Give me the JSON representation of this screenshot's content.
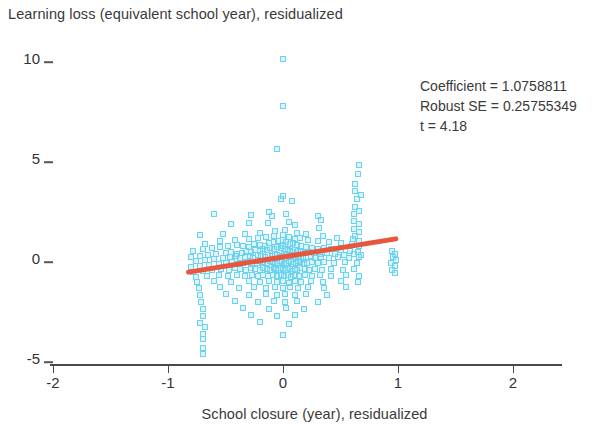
{
  "chart_data": {
    "type": "scatter",
    "title": "",
    "ylabel": "Learning loss (equivalent school year), residualized",
    "xlabel": "School closure (year), residualized",
    "xlim": [
      -2.4,
      2.45
    ],
    "ylim": [
      -5.6,
      10.6
    ],
    "xticks": [
      -2,
      -1,
      0,
      1,
      2
    ],
    "xtick_labels": [
      "-2",
      "-1",
      "0",
      "1",
      "2"
    ],
    "yticks": [
      10,
      5,
      0,
      -5
    ],
    "ytick_labels": [
      "10",
      "5",
      "0",
      "-5"
    ],
    "grid": false,
    "legend": null,
    "marker": {
      "shape": "square-hollow",
      "color": "#6ad2ef",
      "size": 6
    },
    "fit_line": {
      "color": "#e8563c",
      "slope": 1.0758811,
      "x_start": -0.845,
      "x_end": 1.0,
      "y_start": -0.7,
      "y_end": 1.0
    },
    "annotations": [
      "Coefficient = 1.0758811",
      "Robust SE = 0.25755349",
      "t = 4.18"
    ],
    "points": [
      [
        0.0,
        9.95
      ],
      [
        0.0,
        7.6
      ],
      [
        -0.05,
        5.45
      ],
      [
        0.66,
        4.65
      ],
      [
        0.65,
        4.2
      ],
      [
        0.63,
        3.7
      ],
      [
        0.63,
        3.35
      ],
      [
        0.68,
        3.15
      ],
      [
        0.64,
        2.95
      ],
      [
        0.0,
        3.1
      ],
      [
        -0.02,
        2.95
      ],
      [
        0.08,
        2.85
      ],
      [
        0.63,
        2.55
      ],
      [
        0.66,
        2.35
      ],
      [
        0.62,
        2.2
      ],
      [
        -0.6,
        2.2
      ],
      [
        -0.28,
        2.15
      ],
      [
        -0.12,
        2.3
      ],
      [
        -0.1,
        2.1
      ],
      [
        0.03,
        2.2
      ],
      [
        0.3,
        2.1
      ],
      [
        0.33,
        1.9
      ],
      [
        0.62,
        1.85
      ],
      [
        0.66,
        1.7
      ],
      [
        -0.45,
        1.7
      ],
      [
        -0.3,
        1.75
      ],
      [
        -0.13,
        1.75
      ],
      [
        0.05,
        1.8
      ],
      [
        0.1,
        1.65
      ],
      [
        0.31,
        1.5
      ],
      [
        0.62,
        1.45
      ],
      [
        0.66,
        1.3
      ],
      [
        0.63,
        1.1
      ],
      [
        -0.72,
        1.15
      ],
      [
        -0.52,
        1.2
      ],
      [
        -0.33,
        1.2
      ],
      [
        -0.2,
        1.25
      ],
      [
        -0.07,
        1.35
      ],
      [
        0.02,
        1.4
      ],
      [
        0.12,
        1.25
      ],
      [
        0.2,
        1.2
      ],
      [
        0.35,
        1.1
      ],
      [
        0.47,
        1.0
      ],
      [
        0.61,
        0.95
      ],
      [
        0.66,
        0.85
      ],
      [
        -0.68,
        0.7
      ],
      [
        -0.55,
        0.85
      ],
      [
        -0.42,
        0.9
      ],
      [
        -0.3,
        0.95
      ],
      [
        -0.22,
        1.0
      ],
      [
        -0.15,
        1.05
      ],
      [
        -0.08,
        1.1
      ],
      [
        0.0,
        1.15
      ],
      [
        0.05,
        1.05
      ],
      [
        0.1,
        0.95
      ],
      [
        0.15,
        1.0
      ],
      [
        0.22,
        0.9
      ],
      [
        0.3,
        0.85
      ],
      [
        0.4,
        0.8
      ],
      [
        0.5,
        0.75
      ],
      [
        0.6,
        0.7
      ],
      [
        0.66,
        0.6
      ],
      [
        -0.78,
        0.35
      ],
      [
        -0.7,
        0.45
      ],
      [
        -0.62,
        0.5
      ],
      [
        -0.55,
        0.55
      ],
      [
        -0.48,
        0.6
      ],
      [
        -0.4,
        0.65
      ],
      [
        -0.35,
        0.6
      ],
      [
        -0.3,
        0.55
      ],
      [
        -0.25,
        0.7
      ],
      [
        -0.2,
        0.65
      ],
      [
        -0.16,
        0.6
      ],
      [
        -0.12,
        0.75
      ],
      [
        -0.08,
        0.8
      ],
      [
        -0.04,
        0.85
      ],
      [
        0.0,
        0.9
      ],
      [
        0.03,
        0.8
      ],
      [
        0.06,
        0.7
      ],
      [
        0.09,
        0.75
      ],
      [
        0.12,
        0.65
      ],
      [
        0.16,
        0.6
      ],
      [
        0.2,
        0.55
      ],
      [
        0.25,
        0.5
      ],
      [
        0.3,
        0.45
      ],
      [
        0.36,
        0.5
      ],
      [
        0.42,
        0.45
      ],
      [
        0.5,
        0.4
      ],
      [
        0.58,
        0.35
      ],
      [
        0.65,
        0.3
      ],
      [
        -0.8,
        0.05
      ],
      [
        -0.72,
        0.1
      ],
      [
        -0.65,
        0.15
      ],
      [
        -0.58,
        0.2
      ],
      [
        -0.5,
        0.25
      ],
      [
        -0.45,
        0.3
      ],
      [
        -0.4,
        0.2
      ],
      [
        -0.36,
        0.25
      ],
      [
        -0.32,
        0.35
      ],
      [
        -0.28,
        0.3
      ],
      [
        -0.24,
        0.4
      ],
      [
        -0.2,
        0.35
      ],
      [
        -0.17,
        0.45
      ],
      [
        -0.14,
        0.4
      ],
      [
        -0.11,
        0.5
      ],
      [
        -0.08,
        0.45
      ],
      [
        -0.05,
        0.55
      ],
      [
        -0.02,
        0.5
      ],
      [
        0.0,
        0.6
      ],
      [
        0.02,
        0.45
      ],
      [
        0.04,
        0.4
      ],
      [
        0.06,
        0.35
      ],
      [
        0.08,
        0.3
      ],
      [
        0.1,
        0.4
      ],
      [
        0.13,
        0.35
      ],
      [
        0.16,
        0.3
      ],
      [
        0.19,
        0.25
      ],
      [
        0.23,
        0.3
      ],
      [
        0.27,
        0.25
      ],
      [
        0.32,
        0.2
      ],
      [
        0.38,
        0.25
      ],
      [
        0.45,
        0.2
      ],
      [
        0.53,
        0.15
      ],
      [
        0.62,
        0.2
      ],
      [
        0.68,
        0.15
      ],
      [
        -0.76,
        -0.15
      ],
      [
        -0.68,
        -0.1
      ],
      [
        -0.6,
        -0.05
      ],
      [
        -0.52,
        0.0
      ],
      [
        -0.46,
        0.05
      ],
      [
        -0.41,
        0.1
      ],
      [
        -0.37,
        0.0
      ],
      [
        -0.33,
        0.05
      ],
      [
        -0.29,
        0.1
      ],
      [
        -0.26,
        0.0
      ],
      [
        -0.22,
        0.15
      ],
      [
        -0.19,
        0.1
      ],
      [
        -0.16,
        0.05
      ],
      [
        -0.13,
        0.15
      ],
      [
        -0.1,
        0.1
      ],
      [
        -0.07,
        0.2
      ],
      [
        -0.05,
        0.15
      ],
      [
        -0.03,
        0.05
      ],
      [
        -0.01,
        0.1
      ],
      [
        0.01,
        0.2
      ],
      [
        0.03,
        0.15
      ],
      [
        0.05,
        0.05
      ],
      [
        0.07,
        0.1
      ],
      [
        0.09,
        0.15
      ],
      [
        0.11,
        0.05
      ],
      [
        0.14,
        0.1
      ],
      [
        0.17,
        0.0
      ],
      [
        0.2,
        0.05
      ],
      [
        0.24,
        0.1
      ],
      [
        0.28,
        0.0
      ],
      [
        0.33,
        0.05
      ],
      [
        0.4,
        0.0
      ],
      [
        0.48,
        0.05
      ],
      [
        0.57,
        0.0
      ],
      [
        0.66,
        0.05
      ],
      [
        0.95,
        0.35
      ],
      [
        0.97,
        0.2
      ],
      [
        0.96,
        0.05
      ],
      [
        0.98,
        -0.1
      ],
      [
        -0.8,
        -0.45
      ],
      [
        -0.72,
        -0.4
      ],
      [
        -0.64,
        -0.35
      ],
      [
        -0.56,
        -0.3
      ],
      [
        -0.5,
        -0.25
      ],
      [
        -0.44,
        -0.2
      ],
      [
        -0.39,
        -0.3
      ],
      [
        -0.35,
        -0.25
      ],
      [
        -0.31,
        -0.2
      ],
      [
        -0.27,
        -0.3
      ],
      [
        -0.23,
        -0.25
      ],
      [
        -0.2,
        -0.15
      ],
      [
        -0.17,
        -0.2
      ],
      [
        -0.14,
        -0.25
      ],
      [
        -0.11,
        -0.15
      ],
      [
        -0.09,
        -0.2
      ],
      [
        -0.07,
        -0.3
      ],
      [
        -0.05,
        -0.25
      ],
      [
        -0.03,
        -0.15
      ],
      [
        -0.01,
        -0.2
      ],
      [
        0.01,
        -0.3
      ],
      [
        0.03,
        -0.25
      ],
      [
        0.05,
        -0.15
      ],
      [
        0.07,
        -0.2
      ],
      [
        0.09,
        -0.3
      ],
      [
        0.11,
        -0.25
      ],
      [
        0.13,
        -0.15
      ],
      [
        0.15,
        -0.2
      ],
      [
        0.18,
        -0.3
      ],
      [
        0.21,
        -0.25
      ],
      [
        0.25,
        -0.2
      ],
      [
        0.3,
        -0.25
      ],
      [
        0.36,
        -0.2
      ],
      [
        0.44,
        -0.25
      ],
      [
        0.54,
        -0.2
      ],
      [
        0.64,
        -0.25
      ],
      [
        0.94,
        -0.25
      ],
      [
        0.97,
        -0.4
      ],
      [
        -0.78,
        -0.7
      ],
      [
        -0.7,
        -0.65
      ],
      [
        -0.62,
        -0.6
      ],
      [
        -0.54,
        -0.55
      ],
      [
        -0.47,
        -0.6
      ],
      [
        -0.42,
        -0.5
      ],
      [
        -0.37,
        -0.55
      ],
      [
        -0.32,
        -0.6
      ],
      [
        -0.28,
        -0.5
      ],
      [
        -0.24,
        -0.55
      ],
      [
        -0.2,
        -0.6
      ],
      [
        -0.17,
        -0.5
      ],
      [
        -0.14,
        -0.55
      ],
      [
        -0.11,
        -0.6
      ],
      [
        -0.08,
        -0.5
      ],
      [
        -0.06,
        -0.55
      ],
      [
        -0.04,
        -0.6
      ],
      [
        -0.02,
        -0.5
      ],
      [
        0.0,
        -0.55
      ],
      [
        0.02,
        -0.6
      ],
      [
        0.04,
        -0.5
      ],
      [
        0.06,
        -0.55
      ],
      [
        0.08,
        -0.65
      ],
      [
        0.1,
        -0.55
      ],
      [
        0.12,
        -0.6
      ],
      [
        0.15,
        -0.5
      ],
      [
        0.19,
        -0.55
      ],
      [
        0.23,
        -0.6
      ],
      [
        0.28,
        -0.55
      ],
      [
        0.34,
        -0.6
      ],
      [
        0.42,
        -0.55
      ],
      [
        0.52,
        -0.6
      ],
      [
        0.62,
        -0.55
      ],
      [
        0.95,
        -0.6
      ],
      [
        0.97,
        -0.75
      ],
      [
        -0.76,
        -0.95
      ],
      [
        -0.66,
        -0.9
      ],
      [
        -0.56,
        -0.85
      ],
      [
        -0.48,
        -0.9
      ],
      [
        -0.4,
        -0.85
      ],
      [
        -0.33,
        -0.9
      ],
      [
        -0.27,
        -0.85
      ],
      [
        -0.22,
        -0.9
      ],
      [
        -0.17,
        -0.85
      ],
      [
        -0.13,
        -0.9
      ],
      [
        -0.09,
        -0.85
      ],
      [
        -0.05,
        -0.9
      ],
      [
        -0.02,
        -0.85
      ],
      [
        0.01,
        -0.9
      ],
      [
        0.04,
        -0.85
      ],
      [
        0.07,
        -0.95
      ],
      [
        0.1,
        -0.85
      ],
      [
        0.14,
        -0.9
      ],
      [
        0.19,
        -0.85
      ],
      [
        0.25,
        -0.9
      ],
      [
        0.32,
        -0.85
      ],
      [
        0.42,
        -0.9
      ],
      [
        0.55,
        -0.85
      ],
      [
        0.66,
        -0.9
      ],
      [
        -0.75,
        -1.2
      ],
      [
        -0.6,
        -1.15
      ],
      [
        -0.45,
        -1.2
      ],
      [
        -0.3,
        -1.15
      ],
      [
        -0.2,
        -1.2
      ],
      [
        -0.12,
        -1.15
      ],
      [
        -0.05,
        -1.2
      ],
      [
        0.0,
        -1.15
      ],
      [
        0.05,
        -1.25
      ],
      [
        0.1,
        -1.15
      ],
      [
        0.16,
        -1.2
      ],
      [
        0.24,
        -1.15
      ],
      [
        0.35,
        -1.2
      ],
      [
        0.5,
        -1.15
      ],
      [
        0.65,
        -1.2
      ],
      [
        -0.73,
        -1.5
      ],
      [
        -0.55,
        -1.45
      ],
      [
        -0.38,
        -1.5
      ],
      [
        -0.25,
        -1.45
      ],
      [
        -0.15,
        -1.5
      ],
      [
        -0.07,
        -1.45
      ],
      [
        0.0,
        -1.5
      ],
      [
        0.06,
        -1.45
      ],
      [
        0.13,
        -1.5
      ],
      [
        0.22,
        -1.45
      ],
      [
        0.36,
        -1.5
      ],
      [
        0.55,
        -1.45
      ],
      [
        -0.72,
        -1.85
      ],
      [
        -0.5,
        -1.8
      ],
      [
        -0.3,
        -1.85
      ],
      [
        -0.15,
        -1.8
      ],
      [
        -0.05,
        -1.85
      ],
      [
        0.02,
        -1.8
      ],
      [
        0.1,
        -1.85
      ],
      [
        0.2,
        -1.8
      ],
      [
        0.38,
        -1.85
      ],
      [
        -0.71,
        -2.2
      ],
      [
        -0.42,
        -2.15
      ],
      [
        -0.22,
        -2.2
      ],
      [
        -0.08,
        -2.15
      ],
      [
        0.02,
        -2.2
      ],
      [
        0.12,
        -2.15
      ],
      [
        0.3,
        -2.2
      ],
      [
        -0.7,
        -2.55
      ],
      [
        -0.35,
        -2.5
      ],
      [
        -0.12,
        -2.55
      ],
      [
        0.03,
        -2.5
      ],
      [
        0.18,
        -2.55
      ],
      [
        -0.7,
        -2.9
      ],
      [
        -0.28,
        -2.85
      ],
      [
        -0.05,
        -2.9
      ],
      [
        0.1,
        -2.85
      ],
      [
        -0.72,
        -3.25
      ],
      [
        -0.68,
        -3.45
      ],
      [
        -0.2,
        -3.2
      ],
      [
        0.05,
        -3.3
      ],
      [
        -0.7,
        -3.8
      ],
      [
        -0.7,
        -4.05
      ],
      [
        0.0,
        -3.85
      ],
      [
        -0.7,
        -4.5
      ],
      [
        -0.7,
        -4.8
      ]
    ]
  },
  "axis": {
    "x_title": "School closure (year), residualized",
    "y_title": "Learning loss (equivalent school year), residualized"
  },
  "stats": {
    "coefficient_line": "Coefficient = 1.0758811",
    "robust_se_line": "Robust SE = 0.25755349",
    "t_line": "t = 4.18"
  }
}
